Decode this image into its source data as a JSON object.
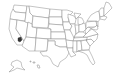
{
  "map": {
    "title": "United States",
    "type": "state-outline",
    "highlight": {
      "label": "Southern California",
      "color": "#333333"
    },
    "colors": {
      "background": "#ffffff",
      "state_fill": "#ffffff",
      "state_stroke": "#8a8a8a"
    }
  }
}
